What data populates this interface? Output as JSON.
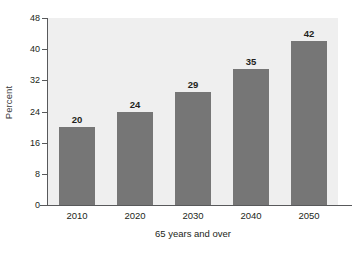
{
  "chart_data": {
    "type": "bar",
    "title": "",
    "xlabel": "65 years and over",
    "ylabel": "Percent",
    "categories": [
      "2010",
      "2020",
      "2030",
      "2040",
      "2050"
    ],
    "values": [
      20,
      24,
      29,
      35,
      42
    ],
    "data_labels": [
      "20",
      "24",
      "29",
      "35",
      "42"
    ],
    "ylim": [
      0,
      48
    ],
    "yticks": [
      0,
      8,
      16,
      24,
      32,
      40,
      48
    ],
    "ytick_labels": [
      "0",
      "8",
      "16",
      "24",
      "32",
      "40",
      "48"
    ],
    "grid": false,
    "legend": null,
    "series": [
      {
        "name": "Percent 65 years and over",
        "values": [
          20,
          24,
          29,
          35,
          42
        ]
      }
    ],
    "colors": {
      "bar": "#767676",
      "plot_background": "#efefef",
      "axis": "#58595b",
      "text": "#231f20",
      "page_background": "#ffffff"
    }
  }
}
